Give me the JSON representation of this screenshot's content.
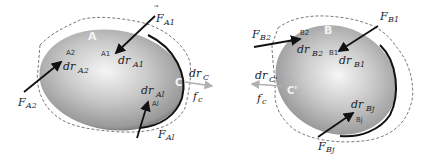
{
  "diagram": {
    "bodies": [
      {
        "id": "A",
        "label": "A",
        "contact_point": "C",
        "forces": [
          {
            "name": "F_A1",
            "symbol": "F",
            "subscript": "A1",
            "point_label": "A1",
            "disp_symbol": "dr",
            "disp_subscript": "A1"
          },
          {
            "name": "F_A2",
            "symbol": "F",
            "subscript": "A2",
            "point_label": "A2",
            "disp_symbol": "dr",
            "disp_subscript": "A2"
          },
          {
            "name": "F_Al",
            "symbol": "F",
            "subscript": "Al",
            "point_label": "Al",
            "disp_symbol": "dr",
            "disp_subscript": "Al"
          }
        ],
        "contact": {
          "label": "C",
          "disp_symbol": "dr",
          "disp_subscript": "C",
          "force_symbol": "f",
          "force_subscript": "c"
        }
      },
      {
        "id": "B",
        "label": "B",
        "contact_point": "C'",
        "forces": [
          {
            "name": "F_B1",
            "symbol": "F",
            "subscript": "B1",
            "point_label": "B1",
            "disp_symbol": "dr",
            "disp_subscript": "B1"
          },
          {
            "name": "F_B2",
            "symbol": "F",
            "subscript": "B2",
            "point_label": "B2",
            "disp_symbol": "dr",
            "disp_subscript": "B2"
          },
          {
            "name": "F_Bj",
            "symbol": "F",
            "subscript": "Bj",
            "point_label": "Bj",
            "disp_symbol": "dr",
            "disp_subscript": "Bj"
          }
        ],
        "contact": {
          "label": "C'",
          "disp_symbol": "dr",
          "disp_subscript": "C'",
          "force_symbol": "f",
          "force_subscript": "c"
        }
      }
    ],
    "colors": {
      "body_light": "#f2f2f2",
      "body_mid": "#b8b8b8",
      "body_dark": "#5a5a5a",
      "edge": "#111111",
      "arrow": "#111111",
      "contact_arrow": "#b0b0b0",
      "dashed": "#555555"
    }
  },
  "labels": {
    "A": "A",
    "B": "B",
    "C": "C",
    "Cp": "C'",
    "F": "F",
    "dr": "dr",
    "f": "f",
    "A1": "A1",
    "A2": "A2",
    "Al": "Al",
    "B1": "B1",
    "B2": "B2",
    "Bj": "Bj",
    "c_sub": "c",
    "C_sub": "C",
    "Cp_sub": "C'"
  }
}
